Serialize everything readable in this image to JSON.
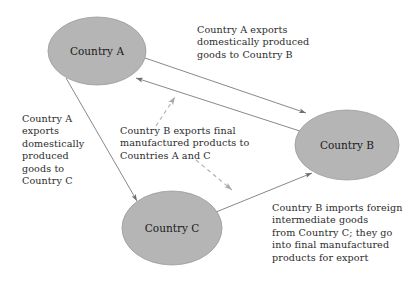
{
  "diagram": {
    "background_color": "#ffffff",
    "node_fill_color": "#b5b5b5",
    "node_stroke_color": "#9a9a9a",
    "line_color": "#7a7a7a",
    "dashed_line_color": "#b0b0b0",
    "text_color": "#2b2b2b",
    "nodes": [
      {
        "id": "country-a",
        "label": "Country A",
        "cx": 97,
        "cy": 51,
        "rx": 49,
        "ry": 34
      },
      {
        "id": "country-b",
        "label": "Country B",
        "cx": 347,
        "cy": 145,
        "rx": 52,
        "ry": 35
      },
      {
        "id": "country-c",
        "label": "Country C",
        "cx": 172,
        "cy": 228,
        "rx": 50,
        "ry": 37
      }
    ],
    "annotations": [
      {
        "id": "a-to-b",
        "text": "Country A exports\ndomestically produced\ngoods to Country B"
      },
      {
        "id": "a-to-c",
        "text": "Country A\nexports\ndomestically\nproduced\ngoods to\nCountry C"
      },
      {
        "id": "b-exports",
        "text": "Country B exports final\nmanufactured products to\nCountries A and C"
      },
      {
        "id": "c-to-b",
        "text": "Country B imports foreign\nintermediate goods\nfrom Country C; they go\ninto final manufactured\nproducts for export"
      }
    ],
    "edges": [
      {
        "id": "edge-a-to-b",
        "from": "country-a",
        "to": "country-b",
        "style": "solid"
      },
      {
        "id": "edge-a-to-c",
        "from": "country-a",
        "to": "country-c",
        "style": "solid"
      },
      {
        "id": "edge-c-to-b",
        "from": "country-c",
        "to": "country-b",
        "style": "solid"
      },
      {
        "id": "edge-b-to-a",
        "from": "country-b",
        "to": "country-a",
        "style": "solid"
      },
      {
        "id": "edge-b-dashed-to-a",
        "from": "country-b",
        "to": "country-a",
        "style": "dashed"
      },
      {
        "id": "edge-b-dashed-to-c",
        "from": "country-b",
        "to": "country-c",
        "style": "dashed"
      }
    ]
  }
}
